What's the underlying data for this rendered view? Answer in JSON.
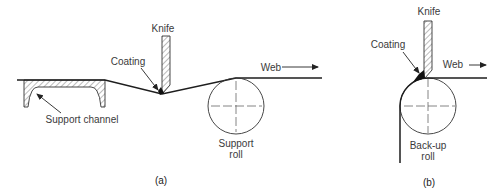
{
  "figure": {
    "panel_a": {
      "caption": "(a)",
      "labels": {
        "knife": "Knife",
        "coating": "Coating",
        "web": "Web",
        "support_channel": "Support channel",
        "support_roll_line1": "Support",
        "support_roll_line2": "roll"
      }
    },
    "panel_b": {
      "caption": "(b)",
      "labels": {
        "knife": "Knife",
        "coating": "Coating",
        "web": "Web",
        "backup_roll_line1": "Back-up",
        "backup_roll_line2": "roll"
      }
    },
    "colors": {
      "line": "#1e1e1e",
      "text": "#3a3a3a",
      "background": "#ffffff"
    }
  }
}
